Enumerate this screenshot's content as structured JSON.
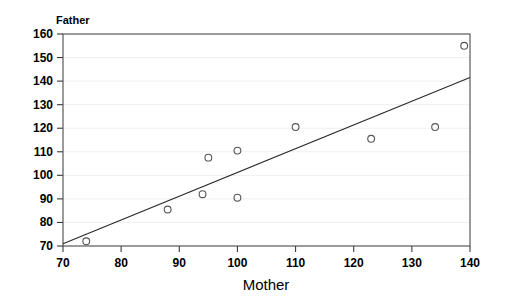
{
  "chart_data": {
    "type": "scatter",
    "title": "",
    "xlabel": "Mother",
    "ylabel": "Father",
    "xlim": [
      70,
      140
    ],
    "ylim": [
      70,
      160
    ],
    "xticks": [
      70,
      80,
      90,
      100,
      110,
      120,
      130,
      140
    ],
    "yticks": [
      70,
      80,
      90,
      100,
      110,
      120,
      130,
      140,
      150,
      160
    ],
    "xtick_labels": [
      "70",
      "80",
      "90",
      "100",
      "110",
      "120",
      "130",
      "140"
    ],
    "ytick_labels": [
      "70",
      "80",
      "90",
      "100",
      "110",
      "120",
      "130",
      "140",
      "150",
      "160"
    ],
    "grid": "horizontal",
    "legend": "none",
    "marker_style": "open-circle",
    "points": [
      {
        "x": 74,
        "y": 72
      },
      {
        "x": 88,
        "y": 85.5
      },
      {
        "x": 94,
        "y": 92
      },
      {
        "x": 95,
        "y": 107.5
      },
      {
        "x": 100,
        "y": 110.5
      },
      {
        "x": 100,
        "y": 90.5
      },
      {
        "x": 110,
        "y": 120.5
      },
      {
        "x": 123,
        "y": 115.5
      },
      {
        "x": 134,
        "y": 120.5
      },
      {
        "x": 139,
        "y": 155
      }
    ],
    "series": [
      {
        "name": "observations",
        "x": [
          74,
          88,
          94,
          95,
          100,
          100,
          110,
          123,
          134,
          139
        ],
        "values": [
          72,
          85.5,
          92,
          107.5,
          110.5,
          90.5,
          120.5,
          115.5,
          120.5,
          155
        ]
      }
    ],
    "fit_line": {
      "name": "regression-line",
      "x_start": 70,
      "y_start": 71,
      "x_end": 140,
      "y_end": 141.5
    },
    "colors": {
      "background": "#ffffff",
      "frame": "#4a4a4a",
      "gridline": "#f0eff0",
      "marker": "#555555",
      "line": "#2b2b2b",
      "text": "#000000"
    }
  }
}
